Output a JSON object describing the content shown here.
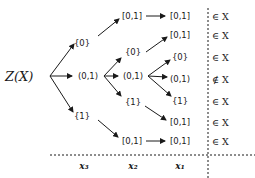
{
  "diagram": {
    "root": "Z(X)",
    "level3": [
      {
        "id": "a0",
        "label": "{0}"
      },
      {
        "id": "a1",
        "label": "(0,1)"
      },
      {
        "id": "a2",
        "label": "{1}"
      }
    ],
    "level2": [
      {
        "id": "b0",
        "label": "[0,1]",
        "parent": "a0"
      },
      {
        "id": "b1",
        "label": "{0}",
        "parent": "a1"
      },
      {
        "id": "b2",
        "label": "(0,1)",
        "parent": "a1"
      },
      {
        "id": "b3",
        "label": "{1}",
        "parent": "a1"
      },
      {
        "id": "b4",
        "label": "[0,1]",
        "parent": "a2"
      }
    ],
    "level1": [
      {
        "id": "c0",
        "label": "[0,1]",
        "parent": "b0",
        "membership": "∈ X"
      },
      {
        "id": "c1",
        "label": "[0,1]",
        "parent": "b1",
        "membership": "∈ X"
      },
      {
        "id": "c2",
        "label": "{0}",
        "parent": "b2",
        "membership": "∈ X"
      },
      {
        "id": "c3",
        "label": "(0,1)",
        "parent": "b2",
        "membership": "∉ X"
      },
      {
        "id": "c4",
        "label": "{1}",
        "parent": "b2",
        "membership": "∈ X"
      },
      {
        "id": "c5",
        "label": "[0,1]",
        "parent": "b3",
        "membership": "∈ X"
      },
      {
        "id": "c6",
        "label": "[0,1]",
        "parent": "b4",
        "membership": "∈ X"
      }
    ],
    "membership_symbol_in": "∈",
    "membership_symbol_notin": "∉",
    "set_name": "X",
    "axis_labels": [
      "x3",
      "x2",
      "x1"
    ],
    "axis_labels_display": {
      "x3": "x₃",
      "x2": "x₂",
      "x1": "x₁"
    }
  }
}
